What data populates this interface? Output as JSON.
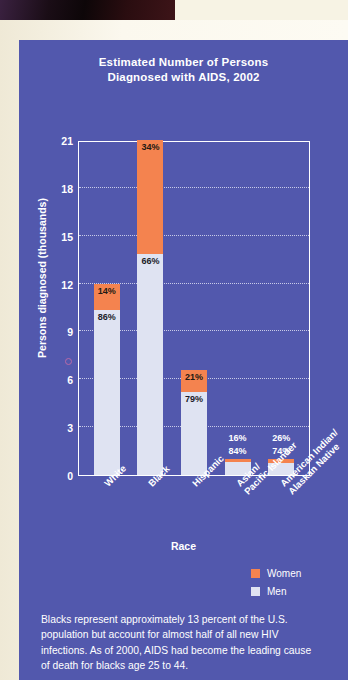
{
  "chart_data": {
    "type": "bar",
    "subtype": "stacked-percentage",
    "title": "Estimated Number of Persons Diagnosed with AIDS, 2002",
    "title_lines": [
      "Estimated Number of Persons",
      "Diagnosed with AIDS, 2002"
    ],
    "xlabel": "Race",
    "ylabel": "Persons diagnosed (thousands)",
    "ylim": [
      0,
      21
    ],
    "yticks": [
      0,
      3,
      6,
      9,
      12,
      15,
      18,
      21
    ],
    "grid": true,
    "legend_position": "bottom-right",
    "categories": [
      "White",
      "Black",
      "Hispanic",
      "Asian/ Pacific Islander",
      "American Indian/ Alaskan Native"
    ],
    "category_lines": [
      [
        "White"
      ],
      [
        "Black"
      ],
      [
        "Hispanic"
      ],
      [
        "Asian/",
        "Pacific Islander"
      ],
      [
        "American Indian/",
        "Alaskan Native"
      ]
    ],
    "series": [
      {
        "name": "Men",
        "color": "#dfe3f2",
        "percent_labels": [
          "86%",
          "66%",
          "79%",
          "84%",
          "74%"
        ],
        "percents": [
          86,
          66,
          79,
          84,
          74
        ],
        "values": [
          10.3,
          13.9,
          5.2,
          0.8,
          0.7
        ]
      },
      {
        "name": "Women",
        "color": "#f4834f",
        "percent_labels": [
          "14%",
          "34%",
          "21%",
          "16%",
          "26%"
        ],
        "percents": [
          14,
          34,
          21,
          16,
          26
        ],
        "values": [
          1.7,
          7.1,
          1.4,
          0.2,
          0.3
        ]
      }
    ],
    "totals": [
      12.0,
      21.0,
      6.6,
      1.0,
      1.0
    ]
  },
  "legend": {
    "items": [
      {
        "label": "Women",
        "color": "#f4834f"
      },
      {
        "label": "Men",
        "color": "#dfe3f2"
      }
    ]
  },
  "footer": {
    "note": "Blacks represent approximately 13 percent of the U.S. population but account for almost half of all new HIV infections. As of 2000, AIDS had become the leading cause of death for blacks age 25 to 44."
  },
  "theme": {
    "panel_background": "#5258ad",
    "page_background": "#f7f3e4",
    "women_color": "#f4834f",
    "men_color": "#dfe3f2",
    "text_color": "#ffffff"
  }
}
